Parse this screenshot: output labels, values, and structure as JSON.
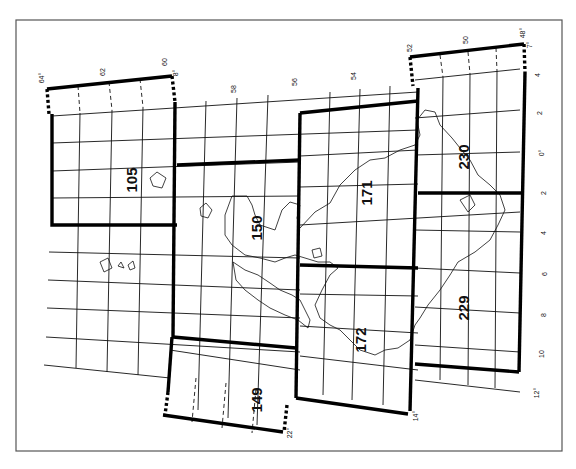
{
  "map": {
    "title": "Map sheet index (rotated)",
    "frame": {
      "x1": 16,
      "y1": 20,
      "x2": 562,
      "y2": 451
    },
    "sheets": [
      {
        "id": "105",
        "label": "105",
        "label_pos": [
          137,
          180
        ]
      },
      {
        "id": "150",
        "label": "150",
        "label_pos": [
          262,
          228
        ]
      },
      {
        "id": "171",
        "label": "171",
        "label_pos": [
          372,
          193
        ]
      },
      {
        "id": "230",
        "label": "230",
        "label_pos": [
          469,
          157
        ]
      },
      {
        "id": "172",
        "label": "172",
        "label_pos": [
          366,
          340
        ]
      },
      {
        "id": "229",
        "label": "229",
        "label_pos": [
          469,
          308
        ]
      },
      {
        "id": "149",
        "label": "149",
        "label_pos": [
          262,
          400
        ]
      }
    ],
    "top_tick_labels": [
      {
        "text": "64°",
        "x": 44,
        "y": 78
      },
      {
        "text": "62",
        "x": 105,
        "y": 72
      },
      {
        "text": "60",
        "x": 167,
        "y": 62
      },
      {
        "text": "8°",
        "x": 178,
        "y": 73
      },
      {
        "text": "58",
        "x": 236,
        "y": 89
      },
      {
        "text": "56",
        "x": 297,
        "y": 82
      },
      {
        "text": "54",
        "x": 356,
        "y": 76
      },
      {
        "text": "52",
        "x": 412,
        "y": 48
      },
      {
        "text": "50",
        "x": 468,
        "y": 40
      },
      {
        "text": "48°",
        "x": 525,
        "y": 33
      },
      {
        "text": "7°",
        "x": 532,
        "y": 45
      }
    ],
    "right_tick_labels": [
      {
        "text": "4",
        "x": 540,
        "y": 75
      },
      {
        "text": "2",
        "x": 542,
        "y": 113
      },
      {
        "text": "0°",
        "x": 544,
        "y": 153
      },
      {
        "text": "2",
        "x": 546,
        "y": 193
      },
      {
        "text": "4",
        "x": 546,
        "y": 233
      },
      {
        "text": "6",
        "x": 547,
        "y": 274
      },
      {
        "text": "8",
        "x": 546,
        "y": 315
      },
      {
        "text": "10",
        "x": 544,
        "y": 354
      },
      {
        "text": "12°",
        "x": 539,
        "y": 393
      }
    ],
    "bottom_tick_labels": [
      {
        "text": "22°",
        "x": 292,
        "y": 433
      },
      {
        "text": "14°",
        "x": 418,
        "y": 416
      }
    ]
  }
}
